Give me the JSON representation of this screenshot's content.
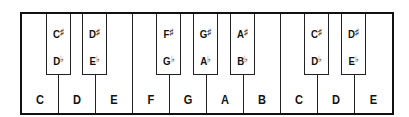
{
  "diagram": {
    "title": "",
    "white_keys": [
      {
        "label": "C"
      },
      {
        "label": "D"
      },
      {
        "label": "E"
      },
      {
        "label": "F"
      },
      {
        "label": "G"
      },
      {
        "label": "A"
      },
      {
        "label": "B"
      },
      {
        "label": "C"
      },
      {
        "label": "D"
      },
      {
        "label": "E"
      }
    ],
    "black_keys": [
      {
        "sharp_note": "C",
        "sharp_symbol": "♯",
        "flat_note": "D",
        "flat_symbol": "♭"
      },
      {
        "sharp_note": "D",
        "sharp_symbol": "♯",
        "flat_note": "E",
        "flat_symbol": "♭"
      },
      {
        "sharp_note": "F",
        "sharp_symbol": "♯",
        "flat_note": "G",
        "flat_symbol": "♭"
      },
      {
        "sharp_note": "G",
        "sharp_symbol": "♯",
        "flat_note": "A",
        "flat_symbol": "♭"
      },
      {
        "sharp_note": "A",
        "sharp_symbol": "♯",
        "flat_note": "B",
        "flat_symbol": "♭"
      },
      {
        "sharp_note": "C",
        "sharp_symbol": "♯",
        "flat_note": "D",
        "flat_symbol": "♭"
      },
      {
        "sharp_note": "D",
        "sharp_symbol": "♯",
        "flat_note": "E",
        "flat_symbol": "♭"
      }
    ],
    "colors": {
      "outline": "#111111",
      "key_fill": "#ffffff",
      "text": "#111111"
    }
  }
}
